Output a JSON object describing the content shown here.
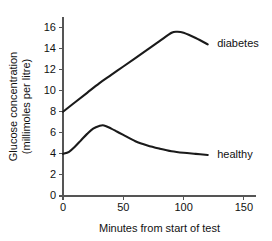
{
  "chart_data": {
    "type": "line",
    "title": "",
    "subtitle": "",
    "xlabel": "Minutes from start of test",
    "ylabel": "Glucose concentration (millimoles per litre)",
    "ylabel_line1": "Glucose concentration",
    "ylabel_line2": "(millimoles per litre)",
    "xlim": [
      0,
      160
    ],
    "ylim": [
      0,
      17
    ],
    "xticks": [
      0,
      50,
      100,
      150
    ],
    "xtick_labels": [
      "0",
      "50",
      "100",
      "150"
    ],
    "yticks": [
      0,
      2,
      4,
      6,
      8,
      10,
      12,
      14,
      16
    ],
    "ytick_labels": [
      "0",
      "2",
      "4",
      "6",
      "8",
      "10",
      "12",
      "14",
      "16"
    ],
    "grid": false,
    "legend_position": "inline-right",
    "line_color": "#1a1a1a",
    "axis_color": "#555555",
    "series": [
      {
        "name": "diabetes",
        "label": "diabetes",
        "label_x": 122,
        "label_y": 14.4,
        "x": [
          0,
          10,
          20,
          30,
          40,
          50,
          60,
          70,
          80,
          90,
          95,
          100,
          110,
          120
        ],
        "values": [
          8.0,
          8.9,
          9.8,
          10.7,
          11.5,
          12.3,
          13.1,
          13.9,
          14.7,
          15.5,
          15.6,
          15.5,
          15.0,
          14.4
        ]
      },
      {
        "name": "healthy",
        "label": "healthy",
        "label_x": 122,
        "label_y": 3.9,
        "x": [
          0,
          5,
          10,
          15,
          20,
          25,
          30,
          34,
          40,
          45,
          50,
          60,
          70,
          80,
          90,
          100,
          110,
          120
        ],
        "values": [
          4.0,
          4.2,
          4.7,
          5.3,
          5.9,
          6.4,
          6.65,
          6.7,
          6.4,
          6.1,
          5.8,
          5.2,
          4.8,
          4.5,
          4.25,
          4.1,
          4.0,
          3.9
        ]
      }
    ]
  }
}
